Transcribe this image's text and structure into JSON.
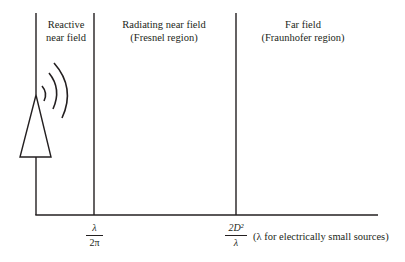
{
  "diagram": {
    "regions": [
      {
        "id": "reactive",
        "line1": "Reactive",
        "line2": "near field"
      },
      {
        "id": "radiating",
        "line1": "Radiating near field",
        "line2": "(Fresnel region)"
      },
      {
        "id": "far",
        "line1": "Far field",
        "line2": "(Fraunhofer region)"
      }
    ],
    "boundaries": [
      {
        "id": "b1",
        "numerator": "λ",
        "denominator": "2π"
      },
      {
        "id": "b2",
        "numerator": "2D²",
        "denominator": "λ",
        "note": "(λ for electrically small sources)"
      }
    ],
    "source": {
      "type": "antenna",
      "waves": 3
    },
    "colors": {
      "stroke": "#231f20",
      "background": "#ffffff"
    }
  }
}
